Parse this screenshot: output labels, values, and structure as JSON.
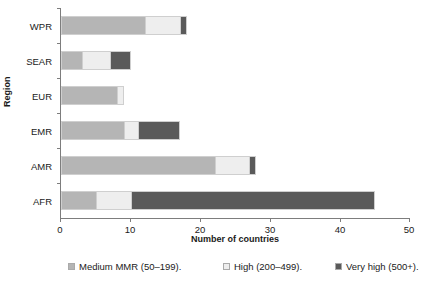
{
  "chart_data": {
    "type": "bar",
    "orientation": "horizontal",
    "stacked": true,
    "title": "",
    "xlabel": "Number of countries",
    "ylabel": "Region",
    "xlim": [
      0,
      50
    ],
    "xticks": [
      0,
      10,
      20,
      30,
      40,
      50
    ],
    "xtick_labels": [
      "0",
      "10",
      "20",
      "30",
      "40",
      "50"
    ],
    "grid": false,
    "legend_position": "bottom",
    "categories": [
      "AFR",
      "AMR",
      "EMR",
      "EUR",
      "SEAR",
      "WPR"
    ],
    "categories_top_to_bottom": [
      "WPR",
      "SEAR",
      "EUR",
      "EMR",
      "AMR",
      "AFR"
    ],
    "series": [
      {
        "name": "Medium MMR (50–199).",
        "color": "#b5b5b5",
        "values": [
          5,
          22,
          9,
          8,
          3,
          12
        ]
      },
      {
        "name": "High (200–499).",
        "color": "#eeeeee",
        "values": [
          5,
          5,
          2,
          1,
          4,
          5
        ]
      },
      {
        "name": "Very high (500+).",
        "color": "#5a5a5a",
        "values": [
          35,
          1,
          6,
          0,
          3,
          1
        ]
      }
    ],
    "totals": [
      45,
      28,
      17,
      9,
      10,
      18
    ]
  },
  "axes": {
    "y_title": "Region",
    "x_title": "Number of countries",
    "y_labels_top_to_bottom": [
      "WPR",
      "SEAR",
      "EUR",
      "EMR",
      "AMR",
      "AFR"
    ],
    "x_tick_labels": [
      "0",
      "10",
      "20",
      "30",
      "40",
      "50"
    ]
  },
  "legend": {
    "items": [
      {
        "label": "Medium MMR (50–199).",
        "color": "#b5b5b5"
      },
      {
        "label": "High (200–499).",
        "color": "#eeeeee"
      },
      {
        "label": "Very high (500+).",
        "color": "#5a5a5a"
      }
    ]
  },
  "colors": {
    "medium": "#b5b5b5",
    "high": "#eeeeee",
    "very_high": "#5a5a5a",
    "axis": "#7d7d7d",
    "bar_outline": "#cfcfcf",
    "text": "#1a1a1a",
    "background": "#ffffff"
  }
}
